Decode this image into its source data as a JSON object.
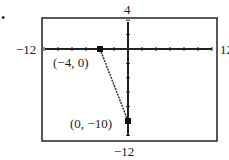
{
  "bullet": "•",
  "labels": {
    "ymax": "4",
    "ymin": "−12",
    "xmin": "−12",
    "xmax": "12",
    "p1": "(−4, 0)",
    "p2": "(0, −10)"
  },
  "chart_data": {
    "type": "line",
    "title": "",
    "xlabel": "",
    "ylabel": "",
    "xlim": [
      -12,
      12
    ],
    "ylim": [
      -12,
      4
    ],
    "x_tick_step": 2,
    "y_tick_step": 2,
    "grid": false,
    "series": [
      {
        "name": "segment",
        "x": [
          -4,
          0
        ],
        "y": [
          0,
          -10
        ]
      }
    ],
    "annotations": [
      {
        "text": "(−4, 0)",
        "x": -4,
        "y": 0
      },
      {
        "text": "(0, −10)",
        "x": 0,
        "y": -10
      }
    ]
  }
}
